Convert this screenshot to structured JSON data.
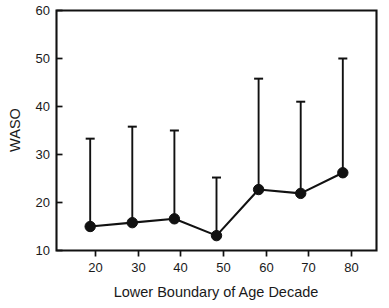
{
  "chart_data": {
    "type": "line",
    "title": "",
    "subtitle": "",
    "xlabel": "Lower Boundary of Age Decade",
    "ylabel": "WASO",
    "categories": [
      20,
      30,
      40,
      50,
      60,
      70,
      80
    ],
    "x_tick_labels": [
      "20",
      "30",
      "40",
      "50",
      "60",
      "70",
      "80"
    ],
    "y_tick_labels": [
      "10",
      "20",
      "30",
      "40",
      "50",
      "60"
    ],
    "y_ticks": [
      10,
      20,
      30,
      40,
      50,
      60
    ],
    "ylim": [
      10,
      60
    ],
    "xlim": [
      12,
      88
    ],
    "grid": false,
    "legend": null,
    "legend_position": "none",
    "marker": "filled-circle",
    "errorbar_style": "upper-only-with-cap",
    "series": [
      {
        "name": "WASO",
        "values": [
          15.0,
          15.8,
          16.6,
          13.1,
          22.7,
          21.9,
          26.2
        ],
        "error_upper_absolute": [
          33.3,
          35.8,
          35.0,
          25.2,
          45.8,
          41.0,
          50.0
        ],
        "color": "#111111"
      }
    ],
    "annotations": []
  },
  "axes": {
    "y_axis_title": "WASO",
    "x_axis_title": "Lower Boundary of Age Decade"
  },
  "colors": {
    "foreground": "#111111",
    "background": "#ffffff",
    "text": "#1a1a1a"
  }
}
